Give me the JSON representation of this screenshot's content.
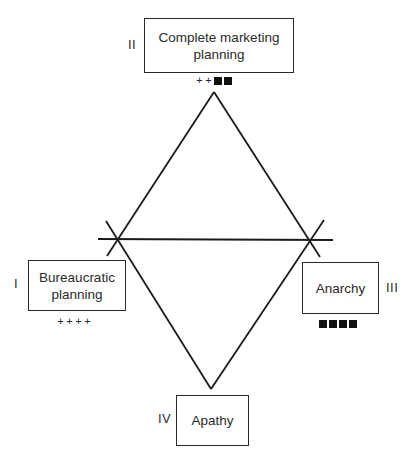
{
  "diagram": {
    "type": "diamond-quadrant",
    "colors": {
      "line": "#1a1a1a",
      "box_border": "#2a2a2a",
      "text": "#2a2a2a",
      "square": "#111111"
    },
    "nodes": [
      {
        "id": "II",
        "numeral": "II",
        "label_line1": "Complete marketing",
        "label_line2": "planning",
        "position": "top",
        "rating": {
          "plus": 2,
          "squares": 2,
          "text": "++■■"
        }
      },
      {
        "id": "I",
        "numeral": "I",
        "label_line1": "Bureaucratic",
        "label_line2": "planning",
        "position": "left",
        "rating": {
          "plus": 4,
          "squares": 0,
          "text": "++++"
        }
      },
      {
        "id": "III",
        "numeral": "III",
        "label_line1": "Anarchy",
        "label_line2": "",
        "position": "right",
        "rating": {
          "plus": 0,
          "squares": 4,
          "text": "■■■■"
        }
      },
      {
        "id": "IV",
        "numeral": "IV",
        "label_line1": "Apathy",
        "label_line2": "",
        "position": "bottom",
        "rating": null
      }
    ],
    "marks": {
      "plus_glyph": "+",
      "square_glyph": "■"
    },
    "geometry": {
      "top_apex": [
        214,
        92
      ],
      "bottom_apex": [
        211,
        389
      ],
      "left_cross": [
        118,
        239
      ],
      "right_cross": [
        309,
        240
      ],
      "horizontal_line": [
        [
          98,
          239
        ],
        [
          333,
          240
        ]
      ]
    }
  }
}
